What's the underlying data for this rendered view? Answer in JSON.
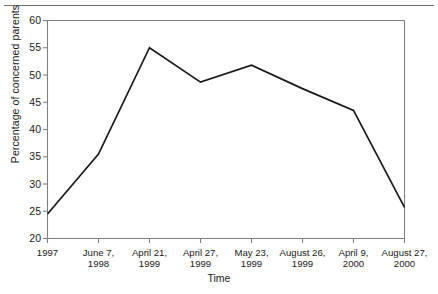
{
  "figure": {
    "top_rule": true,
    "background": "#ffffff",
    "line_color": "#1a1a1a",
    "axis_color": "#808080"
  },
  "chart_data": {
    "type": "line",
    "title": "",
    "xlabel": "Time",
    "ylabel": "Percentage of concerned parents",
    "categories": [
      "1997",
      "June 7, 1998",
      "April 21, 1999",
      "April 27, 1999",
      "May 23, 1999",
      "August 26, 1999",
      "April 9, 2000",
      "August 27, 2000"
    ],
    "category_lines": [
      [
        "1997",
        ""
      ],
      [
        "June 7,",
        "1998"
      ],
      [
        "April 21,",
        "1999"
      ],
      [
        "April 27,",
        "1999"
      ],
      [
        "May 23,",
        "1999"
      ],
      [
        "August 26,",
        "1999"
      ],
      [
        "April 9,",
        "2000"
      ],
      [
        "August 27,",
        "2000"
      ]
    ],
    "values": [
      24.5,
      35.5,
      55.0,
      48.7,
      51.8,
      47.5,
      43.5,
      25.7
    ],
    "ylim": [
      20,
      60
    ],
    "yticks": [
      20,
      25,
      30,
      35,
      40,
      45,
      50,
      55,
      60
    ],
    "ytick_labels": [
      "20",
      "25",
      "30",
      "35",
      "40",
      "45",
      "50",
      "55",
      "60"
    ],
    "grid": false,
    "legend": null,
    "markers": false
  }
}
